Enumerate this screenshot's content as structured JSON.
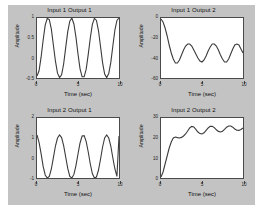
{
  "figure": {
    "background_color": "#c3c3c3",
    "axes_background_color": "#ffffff",
    "line_color": "#3b3b3b"
  },
  "chart_data": [
    {
      "type": "line",
      "title": "Input 1 Output 1",
      "xlabel": "Time (sec)",
      "ylabel": "Amplitude",
      "xlim": [
        0,
        10
      ],
      "ylim": [
        -0.5,
        1
      ],
      "xticks": [
        0,
        5,
        10
      ],
      "xticklabels": [
        "0",
        "5",
        "10"
      ],
      "yticks": [
        -0.5,
        0,
        0.5,
        1
      ],
      "yticklabels": [
        "-0.5",
        "0",
        "0.5",
        "1"
      ],
      "grid": false,
      "legend": "none",
      "description": "Sustained sinusoidal oscillation, about 4 cycles over 10 seconds, starting near the minimum and oscillating between -0.5 and 1.",
      "x": [
        0,
        0.25,
        0.5,
        0.75,
        1,
        1.25,
        1.5,
        1.75,
        2,
        2.25,
        2.5,
        2.75,
        3,
        3.25,
        3.5,
        3.75,
        4,
        4.25,
        4.5,
        4.75,
        5,
        5.25,
        5.5,
        5.75,
        6,
        6.25,
        6.5,
        6.75,
        7,
        7.25,
        7.5,
        7.75,
        8,
        8.25,
        8.5,
        8.75,
        9,
        9.25,
        9.5,
        9.75,
        10
      ],
      "y": [
        -0.45,
        -0.32,
        0.02,
        0.45,
        0.82,
        0.99,
        0.96,
        0.72,
        0.32,
        -0.08,
        -0.38,
        -0.49,
        -0.42,
        -0.15,
        0.26,
        0.66,
        0.92,
        1.0,
        0.85,
        0.52,
        0.1,
        -0.27,
        -0.47,
        -0.47,
        -0.28,
        0.09,
        0.5,
        0.84,
        0.99,
        0.94,
        0.68,
        0.28,
        -0.12,
        -0.4,
        -0.49,
        -0.39,
        -0.11,
        0.3,
        0.7,
        0.94,
        1.0
      ]
    },
    {
      "type": "line",
      "title": "Input 1 Output 2",
      "xlabel": "Time (sec)",
      "ylabel": "Amplitude",
      "xlim": [
        0,
        10
      ],
      "ylim": [
        -60,
        0
      ],
      "xticks": [
        0,
        5,
        10
      ],
      "xticklabels": [
        "0",
        "5",
        "10"
      ],
      "yticks": [
        -60,
        -40,
        -20,
        0
      ],
      "yticklabels": [
        "-60",
        "-40",
        "-20",
        "0"
      ],
      "grid": false,
      "legend": "none",
      "description": "Starts at 0, drops sharply to about -45, then oscillates with roughly constant amplitude around a mean near -33.",
      "x": [
        0,
        0.25,
        0.5,
        0.75,
        1,
        1.25,
        1.5,
        1.75,
        2,
        2.25,
        2.5,
        2.75,
        3,
        3.25,
        3.5,
        3.75,
        4,
        4.25,
        4.5,
        4.75,
        5,
        5.25,
        5.5,
        5.75,
        6,
        6.25,
        6.5,
        6.75,
        7,
        7.25,
        7.5,
        7.75,
        8,
        8.25,
        8.5,
        8.75,
        9,
        9.25,
        9.5,
        9.75,
        10
      ],
      "y": [
        -1,
        -4,
        -10,
        -18,
        -27,
        -35,
        -41,
        -45,
        -45,
        -42,
        -37,
        -32,
        -28,
        -26,
        -26,
        -28,
        -32,
        -36,
        -40,
        -43,
        -44,
        -42,
        -38,
        -33,
        -29,
        -26,
        -26,
        -28,
        -32,
        -37,
        -41,
        -44,
        -44,
        -41,
        -36,
        -31,
        -27,
        -26,
        -27,
        -31,
        -35
      ]
    },
    {
      "type": "line",
      "title": "Input 2 Output 1",
      "xlabel": "Time (sec)",
      "ylabel": "Amplitude",
      "xlim": [
        0,
        10
      ],
      "ylim": [
        -1,
        2
      ],
      "xticks": [
        0,
        5,
        10
      ],
      "xticklabels": [
        "0",
        "5",
        "10"
      ],
      "yticks": [
        -1,
        0,
        1,
        2
      ],
      "yticklabels": [
        "-1",
        "0",
        "1",
        "2"
      ],
      "grid": false,
      "legend": "none",
      "description": "Sustained sinusoidal oscillation, about 4 cycles over 10 seconds, swinging between -1 and 1.2.",
      "x": [
        0,
        0.25,
        0.5,
        0.75,
        1,
        1.25,
        1.5,
        1.75,
        2,
        2.25,
        2.5,
        2.75,
        3,
        3.25,
        3.5,
        3.75,
        4,
        4.25,
        4.5,
        4.75,
        5,
        5.25,
        5.5,
        5.75,
        6,
        6.25,
        6.5,
        6.75,
        7,
        7.25,
        7.5,
        7.75,
        8,
        8.25,
        8.5,
        8.75,
        9,
        9.25,
        9.5,
        9.75,
        10
      ],
      "y": [
        1.15,
        0.78,
        0.22,
        -0.42,
        -0.85,
        -1.0,
        -0.92,
        -0.55,
        0.02,
        0.6,
        1.0,
        1.15,
        1.02,
        0.62,
        0.05,
        -0.52,
        -0.92,
        -1.0,
        -0.82,
        -0.38,
        0.2,
        0.75,
        1.1,
        1.12,
        0.82,
        0.3,
        -0.3,
        -0.78,
        -1.0,
        -0.95,
        -0.6,
        -0.05,
        0.55,
        1.0,
        1.15,
        1.0,
        0.6,
        0.0,
        -0.55,
        -0.92,
        1.1
      ]
    },
    {
      "type": "line",
      "title": "Input 2 Output 2",
      "xlabel": "Time (sec)",
      "ylabel": "Amplitude",
      "xlim": [
        0,
        10
      ],
      "ylim": [
        0,
        30
      ],
      "xticks": [
        0,
        5,
        10
      ],
      "xticklabels": [
        "0",
        "5",
        "10"
      ],
      "yticks": [
        0,
        10,
        20,
        30
      ],
      "yticklabels": [
        "0",
        "10",
        "20",
        "30"
      ],
      "grid": false,
      "legend": "none",
      "description": "Rises steeply from 0 to about 20 within the first 2 seconds, then settles into a small oscillation around 23 to 26.",
      "x": [
        0,
        0.25,
        0.5,
        0.75,
        1,
        1.25,
        1.5,
        1.75,
        2,
        2.25,
        2.5,
        2.75,
        3,
        3.25,
        3.5,
        3.75,
        4,
        4.25,
        4.5,
        4.75,
        5,
        5.25,
        5.5,
        5.75,
        6,
        6.25,
        6.5,
        6.75,
        7,
        7.25,
        7.5,
        7.75,
        8,
        8.25,
        8.5,
        8.75,
        9,
        9.25,
        9.5,
        9.75,
        10
      ],
      "y": [
        0.5,
        3,
        7,
        11,
        15,
        18,
        20,
        20.5,
        20.2,
        20,
        20.3,
        21,
        22,
        23.5,
        25,
        25.8,
        25.5,
        24.3,
        23,
        22.2,
        22,
        22.6,
        23.8,
        25,
        25.8,
        25.9,
        25.2,
        24.1,
        23.3,
        23,
        23.4,
        24.3,
        25.4,
        26,
        26,
        25.4,
        24.5,
        23.9,
        23.8,
        24.3,
        25
      ]
    }
  ]
}
